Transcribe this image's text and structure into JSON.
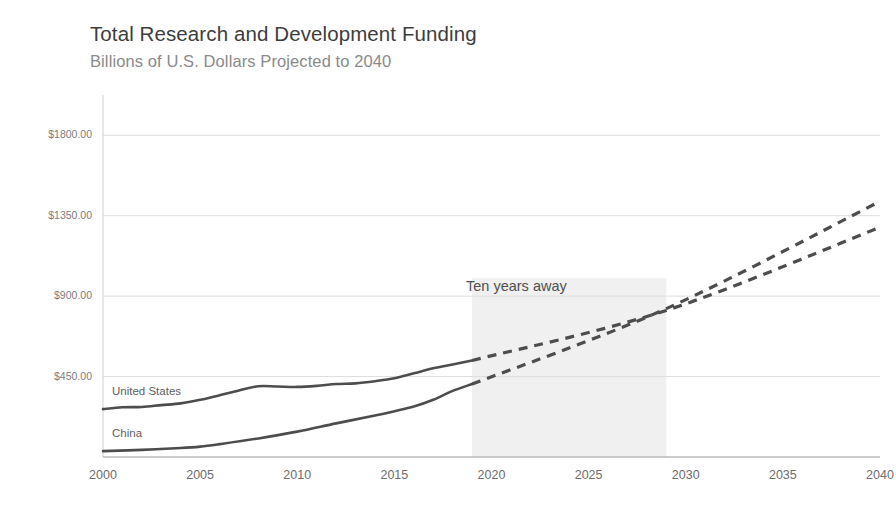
{
  "header": {
    "title": "Total Research and Development Funding",
    "subtitle": "Billions of U.S. Dollars Projected to 2040"
  },
  "chart_data": {
    "type": "line",
    "title": "Total Research and Development Funding",
    "subtitle": "Billions of U.S. Dollars Projected to 2040",
    "xlabel": "",
    "ylabel": "",
    "x": [
      2000,
      2005,
      2010,
      2015,
      2020,
      2025,
      2030,
      2035,
      2040
    ],
    "xlim": [
      2000,
      2040
    ],
    "ylim": [
      0,
      2025
    ],
    "grid": true,
    "legend_position": "inline-left",
    "y_tick_labels": [
      "$1800.00",
      "$1350.00",
      "$900.00",
      "$450.00"
    ],
    "y_tick_values": [
      1800,
      1350,
      900,
      450
    ],
    "x_tick_labels": [
      "2000",
      "2005",
      "2010",
      "2015",
      "2020",
      "2025",
      "2030",
      "2035",
      "2040"
    ],
    "projection_start_year": 2019,
    "series": [
      {
        "name": "United States",
        "color": "#4d4d4d",
        "historical": [
          {
            "year": 2000,
            "value": 268
          },
          {
            "year": 2001,
            "value": 278
          },
          {
            "year": 2002,
            "value": 280
          },
          {
            "year": 2003,
            "value": 290
          },
          {
            "year": 2004,
            "value": 300
          },
          {
            "year": 2005,
            "value": 320
          },
          {
            "year": 2006,
            "value": 345
          },
          {
            "year": 2007,
            "value": 372
          },
          {
            "year": 2008,
            "value": 396
          },
          {
            "year": 2009,
            "value": 394
          },
          {
            "year": 2010,
            "value": 392
          },
          {
            "year": 2011,
            "value": 398
          },
          {
            "year": 2012,
            "value": 408
          },
          {
            "year": 2013,
            "value": 412
          },
          {
            "year": 2014,
            "value": 424
          },
          {
            "year": 2015,
            "value": 440
          },
          {
            "year": 2016,
            "value": 468
          },
          {
            "year": 2017,
            "value": 496
          },
          {
            "year": 2018,
            "value": 518
          },
          {
            "year": 2019,
            "value": 540
          }
        ],
        "projected": [
          {
            "year": 2019,
            "value": 540
          },
          {
            "year": 2029,
            "value": 820
          },
          {
            "year": 2040,
            "value": 1285
          }
        ]
      },
      {
        "name": "China",
        "color": "#4d4d4d",
        "historical": [
          {
            "year": 2000,
            "value": 33
          },
          {
            "year": 2002,
            "value": 40
          },
          {
            "year": 2004,
            "value": 50
          },
          {
            "year": 2005,
            "value": 58
          },
          {
            "year": 2006,
            "value": 72
          },
          {
            "year": 2008,
            "value": 104
          },
          {
            "year": 2010,
            "value": 142
          },
          {
            "year": 2012,
            "value": 188
          },
          {
            "year": 2014,
            "value": 232
          },
          {
            "year": 2015,
            "value": 256
          },
          {
            "year": 2016,
            "value": 282
          },
          {
            "year": 2017,
            "value": 320
          },
          {
            "year": 2018,
            "value": 370
          },
          {
            "year": 2019,
            "value": 408
          }
        ],
        "projected": [
          {
            "year": 2019,
            "value": 408
          },
          {
            "year": 2029,
            "value": 830
          },
          {
            "year": 2040,
            "value": 1430
          }
        ]
      }
    ],
    "annotations": [
      {
        "text": "Ten years away",
        "x_range": [
          2019,
          2029
        ],
        "kind": "shaded-band-label"
      }
    ],
    "shaded_band": {
      "from_year": 2019,
      "to_year": 2029,
      "color": "#f0f0f0"
    }
  },
  "labels": {
    "series_us": "United States",
    "series_china": "China",
    "annotation_band": "Ten years away"
  }
}
